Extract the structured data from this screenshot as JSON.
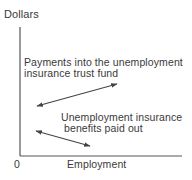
{
  "diagram": {
    "y_axis_title": "Dollars",
    "x_axis_title": "Employment",
    "origin_label": "0",
    "payments": {
      "line1": "Payments into the unemployment",
      "line2": "insurance trust fund",
      "arrow": "double-headed, sloping upward (positive relation with employment)"
    },
    "benefits": {
      "line1": "Unemployment insurance",
      "line2": " benefits paid out",
      "arrow": "double-headed, sloping downward (negative relation with employment)"
    },
    "colors": {
      "axis": "#555555",
      "arrow": "#444444",
      "text": "#3a3a3a",
      "background": "#ffffff"
    }
  }
}
